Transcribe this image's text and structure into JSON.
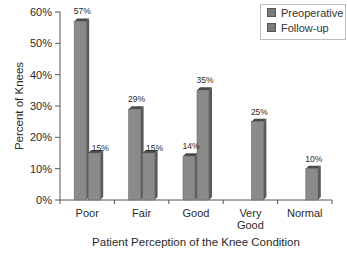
{
  "chart_data": {
    "type": "bar",
    "title": "",
    "xlabel": "Patient Perception of the Knee Condition",
    "ylabel": "Percent of Knees",
    "ylim": [
      0,
      60
    ],
    "yticks": [
      "0%",
      "10%",
      "20%",
      "30%",
      "40%",
      "50%",
      "60%"
    ],
    "categories": [
      "Poor",
      "Fair",
      "Good",
      "Very Good",
      "Normal"
    ],
    "category_lines": [
      [
        "Poor"
      ],
      [
        "Fair"
      ],
      [
        "Good"
      ],
      [
        "Very",
        "Good"
      ],
      [
        "Normal"
      ]
    ],
    "series": [
      {
        "name": "Preoperative",
        "values": [
          57,
          29,
          14,
          0,
          0
        ],
        "labels": [
          "57%",
          "29%",
          "14%",
          "",
          ""
        ]
      },
      {
        "name": "Follow-up",
        "values": [
          15,
          15,
          35,
          25,
          10
        ],
        "labels": [
          "15%",
          "15%",
          "35%",
          "25%",
          "10%"
        ]
      }
    ],
    "legend_position": "top-right",
    "grid": false,
    "style": "3d-bar"
  },
  "legend": {
    "items": [
      {
        "label": "Preoperative"
      },
      {
        "label": "Follow-up"
      }
    ]
  },
  "colors": {
    "bar_front": "#8a8a8a",
    "bar_side": "#5a5a5a",
    "bar_top": "#4a4a4a",
    "axis": "#555555",
    "text": "#2a2a2a"
  }
}
